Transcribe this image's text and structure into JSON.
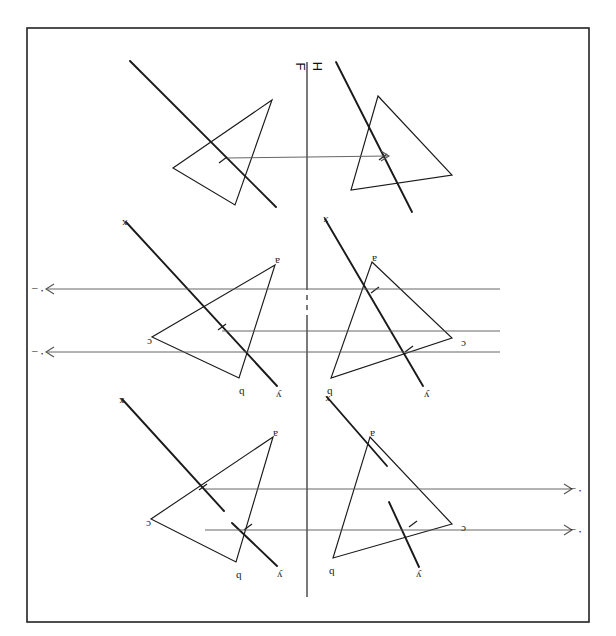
{
  "page": {
    "number": "68",
    "orientation_note": "180-rotated scan",
    "background": "#ffffff",
    "ink": "#1a1a1a",
    "thin_ink": "#555555",
    "width": 616,
    "height": 636
  },
  "border": {
    "name": "plate-border",
    "x": 27,
    "y": 28,
    "width": 562,
    "height": 594,
    "stroke": "#222222",
    "stroke_width": 1.6
  },
  "fold_line": {
    "label_front": "F",
    "label_horizontal": "H",
    "separator": "|",
    "x": 307,
    "y_top": 62,
    "y_bottom": 597,
    "dash_from": 285,
    "dash_to": 320,
    "stroke": "#333333"
  },
  "problems": [
    {
      "id": "top",
      "name": "problem-top",
      "left_view": {
        "triangle": [
          [
            272,
            100
          ],
          [
            173,
            168
          ],
          [
            235,
            205
          ]
        ],
        "oblique_line": [
          [
            130,
            61
          ],
          [
            276,
            207
          ]
        ],
        "vertex_labels": [],
        "tick_marks": [
          {
            "x": 223,
            "y": 160
          }
        ]
      },
      "right_view": {
        "triangle": [
          [
            378,
            96
          ],
          [
            351,
            190
          ],
          [
            452,
            175
          ]
        ],
        "oblique_line": [
          [
            336,
            62
          ],
          [
            412,
            212
          ]
        ],
        "vertex_labels": [],
        "tick_marks": [
          {
            "x": 383,
            "y": 157
          }
        ]
      },
      "projectors": [
        {
          "from": [
            227,
            158
          ],
          "to": [
            389,
            156
          ],
          "arrow": "right",
          "arrow_at": [
            389,
            156
          ]
        }
      ]
    },
    {
      "id": "middle",
      "name": "problem-middle",
      "left_view": {
        "triangle": [
          [
            275,
            265
          ],
          [
            152,
            337
          ],
          [
            239,
            378
          ]
        ],
        "oblique_line": [
          [
            126,
            222
          ],
          [
            277,
            386
          ]
        ],
        "vertex_labels": [
          {
            "text": "a",
            "x": 275,
            "y": 256
          },
          {
            "text": "c",
            "x": 147,
            "y": 337
          },
          {
            "text": "b",
            "x": 239,
            "y": 387
          },
          {
            "text": "x",
            "x": 122,
            "y": 218
          },
          {
            "text": "y",
            "x": 276,
            "y": 390
          }
        ],
        "tick_marks": [
          {
            "x": 222,
            "y": 327
          }
        ]
      },
      "right_view": {
        "triangle": [
          [
            372,
            262
          ],
          [
            452,
            338
          ],
          [
            331,
            378
          ]
        ],
        "oblique_line": [
          [
            325,
            219
          ],
          [
            423,
            386
          ]
        ],
        "vertex_labels": [
          {
            "text": "a",
            "x": 372,
            "y": 254
          },
          {
            "text": "c",
            "x": 461,
            "y": 339
          },
          {
            "text": "b",
            "x": 327,
            "y": 387
          },
          {
            "text": "x",
            "x": 323,
            "y": 215
          },
          {
            "text": "y",
            "x": 424,
            "y": 390
          }
        ],
        "tick_marks": [
          {
            "x": 375,
            "y": 290
          },
          {
            "x": 409,
            "y": 349
          }
        ]
      },
      "projectors": [
        {
          "from": [
            500,
            289
          ],
          "to": [
            46,
            289
          ],
          "arrow": "left",
          "arrow_at": [
            46,
            289
          ]
        },
        {
          "from": [
            500,
            331
          ],
          "to": [
            222,
            331
          ],
          "arrow": "none",
          "arrow_at": null
        },
        {
          "from": [
            500,
            352
          ],
          "to": [
            46,
            352
          ],
          "arrow": "left",
          "arrow_at": [
            46,
            352
          ]
        }
      ]
    },
    {
      "id": "bottom",
      "name": "problem-bottom",
      "left_view": {
        "triangle": [
          [
            273,
            437
          ],
          [
            151,
            519
          ],
          [
            236,
            562
          ]
        ],
        "oblique_line": [
          [
            122,
            399
          ],
          [
            224,
            511
          ]
        ],
        "oblique_line2": [
          [
            232,
            523
          ],
          [
            277,
            566
          ]
        ],
        "vertex_labels": [
          {
            "text": "a",
            "x": 273,
            "y": 429
          },
          {
            "text": "c",
            "x": 146,
            "y": 519
          },
          {
            "text": "b",
            "x": 236,
            "y": 571
          },
          {
            "text": "x",
            "x": 119,
            "y": 396
          },
          {
            "text": "y",
            "x": 277,
            "y": 570
          }
        ],
        "tick_marks": [
          {
            "x": 203,
            "y": 487
          },
          {
            "x": 248,
            "y": 527
          }
        ]
      },
      "right_view": {
        "triangle": [
          [
            370,
            437
          ],
          [
            452,
            524
          ],
          [
            333,
            558
          ]
        ],
        "oblique_line": [
          [
            327,
            397
          ],
          [
            387,
            466
          ]
        ],
        "oblique_line2": [
          [
            389,
            502
          ],
          [
            419,
            567
          ]
        ],
        "vertex_labels": [
          {
            "text": "a",
            "x": 370,
            "y": 429
          },
          {
            "text": "c",
            "x": 461,
            "y": 524
          },
          {
            "text": "b",
            "x": 329,
            "y": 567
          },
          {
            "text": "x",
            "x": 325,
            "y": 394
          },
          {
            "text": "y",
            "x": 416,
            "y": 570
          }
        ],
        "tick_marks": [
          {
            "x": 413,
            "y": 524
          }
        ]
      },
      "projectors": [
        {
          "from": [
            205,
            489
          ],
          "to": [
            572,
            489
          ],
          "arrow": "right",
          "arrow_at": [
            572,
            489
          ]
        },
        {
          "from": [
            205,
            530
          ],
          "to": [
            572,
            530
          ],
          "arrow": "right",
          "arrow_at": [
            572,
            530
          ]
        }
      ]
    }
  ],
  "arrow_tags": [
    {
      "name": "arrow-tag-left-upper",
      "text": "·",
      "x": 40,
      "y": 285
    },
    {
      "name": "arrow-tag-left-lower",
      "text": "·",
      "x": 40,
      "y": 348
    },
    {
      "name": "arrow-tag-right-upper",
      "text": "·",
      "x": 578,
      "y": 485
    },
    {
      "name": "arrow-tag-right-lower",
      "text": "·",
      "x": 578,
      "y": 526
    }
  ]
}
